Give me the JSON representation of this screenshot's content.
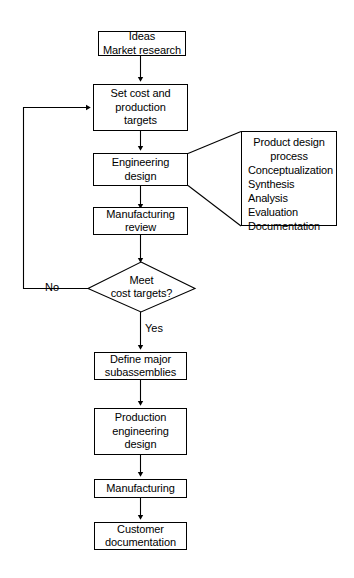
{
  "diagram": {
    "type": "flowchart",
    "nodes": {
      "ideas": {
        "line1": "Ideas",
        "line2": "Market research"
      },
      "set_cost": {
        "line1": "Set cost and",
        "line2": "production",
        "line3": "targets"
      },
      "engineering_design": {
        "line1": "Engineering",
        "line2": "design"
      },
      "manufacturing_review": {
        "line1": "Manufacturing",
        "line2": "review"
      },
      "decision": {
        "line1": "Meet",
        "line2": "cost targets?"
      },
      "define_subassemblies": {
        "line1": "Define major",
        "line2": "subassemblies"
      },
      "production_engineering": {
        "line1": "Production",
        "line2": "engineering",
        "line3": "design"
      },
      "manufacturing": {
        "line1": "Manufacturing"
      },
      "customer_documentation": {
        "line1": "Customer",
        "line2": "documentation"
      }
    },
    "edge_labels": {
      "no": "No",
      "yes": "Yes"
    },
    "side_box": {
      "title_line1": "Product design",
      "title_line2": "process",
      "items": [
        "Conceptualization",
        "Synthesis",
        "Analysis",
        "Evaluation",
        "Documentation"
      ]
    },
    "colors": {
      "line": "#000000",
      "background": "#ffffff",
      "text": "#000000"
    }
  }
}
